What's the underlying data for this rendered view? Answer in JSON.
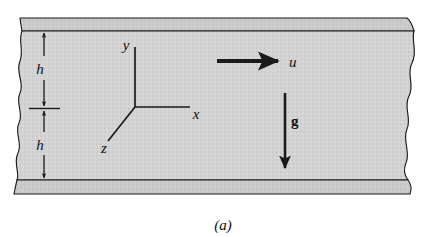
{
  "figure": {
    "caption": "(a)",
    "colors": {
      "fluid_fill": "#d2d2d2",
      "wall_fill": "#c8c8c8",
      "line": "#1a1a1a",
      "background": "#ffffff"
    }
  },
  "labels": {
    "h_upper": "h",
    "h_lower": "h",
    "axis_x": "x",
    "axis_y": "y",
    "axis_z": "z",
    "velocity": "u",
    "gravity": "g"
  },
  "geometry": {
    "channel_left_break_x": 17,
    "channel_right_break_x": 408,
    "top_wall_y": 18,
    "top_wall_bottom_y": 31,
    "bottom_wall_y": 180,
    "bottom_wall_bottom_y": 194,
    "centerline_y": 108,
    "origin_x": 135,
    "origin_y": 107
  },
  "arrows": {
    "velocity_arrow": {
      "name": "u-arrow",
      "direction": "right",
      "x1": 217,
      "y1": 61,
      "x2": 278,
      "y2": 61
    },
    "gravity_arrow": {
      "name": "g-arrow",
      "direction": "down",
      "x1": 285,
      "y1": 93,
      "x2": 285,
      "y2": 168
    },
    "dim_upper_top": {
      "name": "h-upper-top-arrow",
      "direction": "up"
    },
    "dim_upper_bottom": {
      "name": "h-upper-bottom-arrow",
      "direction": "down"
    },
    "dim_lower_top": {
      "name": "h-lower-top-arrow",
      "direction": "up"
    },
    "dim_lower_bottom": {
      "name": "h-lower-bottom-arrow",
      "direction": "down"
    }
  }
}
